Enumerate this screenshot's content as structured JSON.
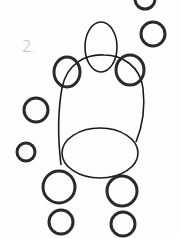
{
  "drawing": {
    "step_label": "2.",
    "stroke_color": "#1c1c1c",
    "label_color": "#b5b5b5",
    "shapes": [
      {
        "name": "head-oval",
        "type": "ellipse"
      },
      {
        "name": "body-outline",
        "type": "path"
      },
      {
        "name": "lower-body-oval",
        "type": "ellipse"
      },
      {
        "name": "left-shoulder-circle",
        "type": "circle"
      },
      {
        "name": "right-shoulder-circle",
        "type": "circle"
      },
      {
        "name": "top-right-circle",
        "type": "circle"
      },
      {
        "name": "right-circle",
        "type": "circle"
      },
      {
        "name": "left-circle",
        "type": "circle"
      },
      {
        "name": "left-lower-circle",
        "type": "circle"
      },
      {
        "name": "left-leg-upper-circle",
        "type": "circle"
      },
      {
        "name": "left-leg-lower-circle",
        "type": "circle"
      },
      {
        "name": "right-leg-upper-circle",
        "type": "circle"
      },
      {
        "name": "right-leg-lower-circle",
        "type": "circle"
      }
    ]
  }
}
